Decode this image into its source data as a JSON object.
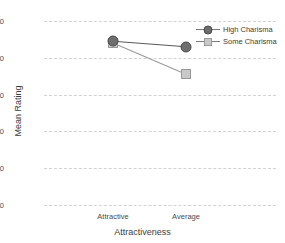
{
  "chart_data": {
    "type": "line",
    "title": "",
    "xlabel": "Attractiveness",
    "ylabel": "Mean Rating",
    "categories": [
      "Attractive",
      "Average"
    ],
    "ylim": [
      0,
      100
    ],
    "yticks": [
      0,
      20,
      40,
      60,
      80,
      100
    ],
    "ytick_labels": [
      "0",
      "20",
      "40",
      "60",
      "80",
      "100"
    ],
    "grid": true,
    "grid_style": "dashed",
    "legend_position": "top-right",
    "series": [
      {
        "name": "High Charisma",
        "values": [
          89,
          86
        ],
        "marker": "circle",
        "color": "#6e6e6e",
        "line_color": "#5a5a5a"
      },
      {
        "name": "Some Charisma",
        "values": [
          88,
          71
        ],
        "marker": "square",
        "color": "#c9c9c9",
        "line_color": "#9a9a9a"
      }
    ]
  },
  "axes": {
    "y_label": "Mean Rating",
    "x_label": "Attractiveness",
    "y_ticks": [
      "0",
      "20",
      "40",
      "60",
      "80",
      "100"
    ],
    "x_ticks": [
      "Attractive",
      "Average"
    ]
  },
  "legend": {
    "entries": [
      {
        "label": "High Charisma",
        "marker": "circle-marker-icon"
      },
      {
        "label": "Some Charisma",
        "marker": "square-marker-icon"
      }
    ]
  }
}
